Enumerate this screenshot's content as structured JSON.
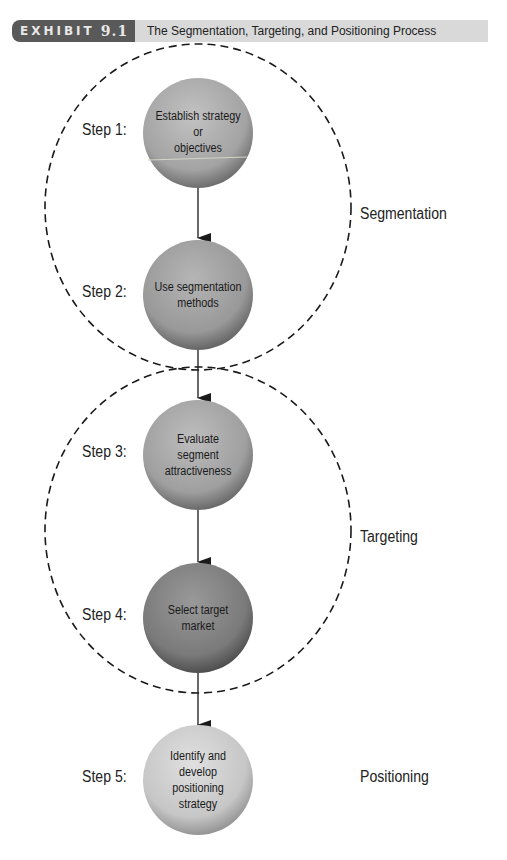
{
  "header": {
    "exhibit_label": "EXHIBIT",
    "exhibit_number": "9.1",
    "title": "The Segmentation, Targeting, and Positioning Process"
  },
  "steps": [
    {
      "label": "Step 1:",
      "node_text": "Establish strategy or objectives",
      "lines": [
        "Establish strategy",
        "or",
        "objectives"
      ],
      "shade": "#a6a6a6"
    },
    {
      "label": "Step 2:",
      "node_text": "Use segmentation methods",
      "lines": [
        "Use segmentation",
        "methods"
      ],
      "shade": "#9a9a9a"
    },
    {
      "label": "Step 3:",
      "node_text": "Evaluate segment attractiveness",
      "lines": [
        "Evaluate",
        "segment",
        "attractiveness"
      ],
      "shade": "#a0a0a0"
    },
    {
      "label": "Step 4:",
      "node_text": "Select target market",
      "lines": [
        "Select target",
        "market"
      ],
      "shade": "#7d7d7d"
    },
    {
      "label": "Step 5:",
      "node_text": "Identify and develop positioning strategy",
      "lines": [
        "Identify and",
        "develop",
        "positioning",
        "strategy"
      ],
      "shade": "#c4c4c4"
    }
  ],
  "phases": [
    {
      "label": "Segmentation",
      "spans_steps": [
        1,
        2
      ]
    },
    {
      "label": "Targeting",
      "spans_steps": [
        3,
        4
      ]
    },
    {
      "label": "Positioning",
      "spans_steps": [
        5
      ]
    }
  ],
  "colors": {
    "exhibit_tag_bg": "#595959",
    "title_bar_bg": "#d9d9d9",
    "dashed_outline": "#1a1a1a",
    "arrow": "#1a1a1a"
  }
}
